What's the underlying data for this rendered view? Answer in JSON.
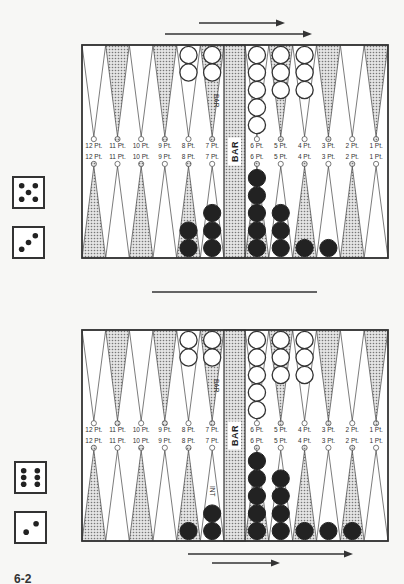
{
  "figure_label": "6-2",
  "bar_label": "BAR",
  "colors": {
    "frame": "#333333",
    "dot_fill": "#9a9a9a",
    "white_checker": "#ffffff",
    "black_checker": "#222222",
    "background": "#f7f7f5"
  },
  "point_labels_left": [
    "12 Pt.",
    "11 Pt.",
    "10 Pt.",
    "9 Pt.",
    "8 Pt.",
    "7 Pt."
  ],
  "point_labels_right": [
    "6 Pt.",
    "5 Pt.",
    "4 Pt.",
    "3 Pt.",
    "2 Pt.",
    "1 Pt."
  ],
  "boards": [
    {
      "name": "before-move",
      "frame": {
        "x": 82,
        "y": 45,
        "w": 306,
        "h": 213
      },
      "arrows_top": [
        {
          "x1": 199,
          "x2": 285,
          "y": 23
        },
        {
          "x1": 165,
          "x2": 312,
          "y": 34
        }
      ],
      "dice": [
        {
          "value": 5,
          "x": 13,
          "y": 177
        },
        {
          "value": 3,
          "x": 13,
          "y": 227
        }
      ],
      "top_checkers": {
        "8": 2,
        "7": 2,
        "6": 5,
        "5": 3,
        "4": 3
      },
      "bottom_checkers": {
        "8": 2,
        "7": 3,
        "6": 5,
        "5": 3,
        "4": 1,
        "3": 1
      },
      "top_point_note": {
        "point": 7,
        "text": "BAR"
      },
      "bottom_point_note": null
    },
    {
      "name": "after-move",
      "frame": {
        "x": 82,
        "y": 330,
        "w": 306,
        "h": 211
      },
      "arrows_bottom": [
        {
          "x1": 188,
          "x2": 353,
          "y": 554
        },
        {
          "x1": 212,
          "x2": 280,
          "y": 563
        }
      ],
      "dice": [
        {
          "value": 6,
          "x": 15,
          "y": 462
        },
        {
          "value": 2,
          "x": 15,
          "y": 512
        }
      ],
      "top_checkers": {
        "8": 2,
        "7": 2,
        "6": 5,
        "5": 3,
        "4": 3
      },
      "bottom_checkers": {
        "8": 1,
        "7": 2,
        "6": 5,
        "5": 4,
        "4": 1,
        "3": 1,
        "2": 1
      },
      "top_point_note": {
        "point": 7,
        "text": "BAR"
      },
      "bottom_point_note": {
        "point": 7,
        "text": "INT"
      }
    }
  ],
  "divider": {
    "x1": 152,
    "x2": 317,
    "y": 292
  }
}
